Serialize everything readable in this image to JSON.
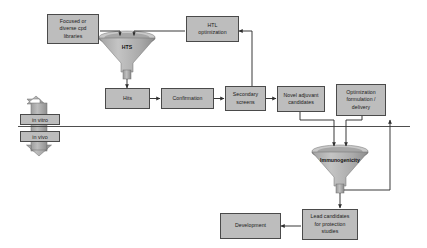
{
  "diagram": {
    "colors": {
      "box_fill": "#bdbdbd",
      "box_border": "#4a4a4a",
      "funnel_fill": "#b0b0b0",
      "funnel_shade": "#8e8e8e",
      "funnel_rim": "#9a9a9a",
      "connector": "#3a3a3a",
      "background": "#ffffff",
      "divider": "#3a3a3a"
    },
    "nodes": [
      {
        "id": "libraries",
        "label": "Focused or diverse cpd libraries"
      },
      {
        "id": "htl",
        "label": "HTL optimization"
      },
      {
        "id": "hits",
        "label": "Hits"
      },
      {
        "id": "confirmation",
        "label": "Confirmation"
      },
      {
        "id": "secondary",
        "label": "Secondary screens"
      },
      {
        "id": "adjuvant",
        "label": "Novel adjuvant candidates"
      },
      {
        "id": "optimization",
        "label": "Optimization formulation / delivery"
      },
      {
        "id": "lead",
        "label": "Lead candidates for protection studies"
      },
      {
        "id": "development",
        "label": "Development"
      }
    ],
    "node_lines": {
      "libraries": [
        "Focused or",
        "diverse cpd",
        "libraries"
      ],
      "htl": [
        "HTL",
        "optimization"
      ],
      "hits": [
        "Hits"
      ],
      "confirmation": [
        "Confirmation"
      ],
      "secondary": [
        "Secondary",
        "screens"
      ],
      "adjuvant": [
        "Novel adjuvant",
        "candidates"
      ],
      "optimization": [
        "Optimization",
        "formulation /",
        "delivery"
      ],
      "lead": [
        "Lead candidates",
        "for protection",
        "studies"
      ],
      "development": [
        "Development"
      ]
    },
    "funnels": [
      {
        "id": "hts",
        "label": "HTS"
      },
      {
        "id": "immunogenicity",
        "label": "Immunogenicity"
      }
    ],
    "phase_tags": [
      {
        "id": "in-vitro",
        "label": "in vitro"
      },
      {
        "id": "in-vivo",
        "label": "in vivo"
      }
    ],
    "flows": [
      {
        "from": "libraries",
        "to": "hts"
      },
      {
        "from": "htl",
        "to": "hts"
      },
      {
        "from": "hts",
        "to": "hits"
      },
      {
        "from": "hits",
        "to": "confirmation"
      },
      {
        "from": "confirmation",
        "to": "secondary"
      },
      {
        "from": "secondary",
        "to": "adjuvant"
      },
      {
        "from": "secondary",
        "to": "htl"
      },
      {
        "from": "adjuvant",
        "to": "immunogenicity"
      },
      {
        "from": "optimization",
        "to": "immunogenicity"
      },
      {
        "from": "immunogenicity",
        "to": "optimization"
      },
      {
        "from": "immunogenicity",
        "to": "lead"
      },
      {
        "from": "lead",
        "to": "development"
      }
    ]
  }
}
